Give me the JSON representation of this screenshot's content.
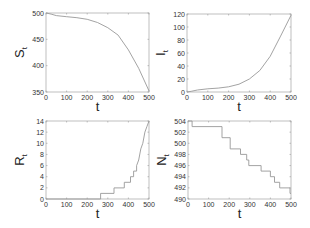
{
  "chart_data": [
    {
      "type": "line",
      "id": "S",
      "title": "",
      "xlabel": "t",
      "ylabel": "S",
      "ylabel_sub": "t",
      "xlim": [
        0,
        500
      ],
      "ylim": [
        350,
        500
      ],
      "xticks": [
        0,
        100,
        200,
        300,
        400,
        500
      ],
      "yticks": [
        350,
        400,
        450,
        500
      ],
      "grid": false,
      "color": "#999999",
      "x": [
        0,
        25,
        50,
        100,
        150,
        200,
        250,
        300,
        350,
        400,
        450,
        500
      ],
      "y": [
        500,
        498,
        495,
        493,
        491,
        488,
        482,
        472,
        458,
        430,
        395,
        352
      ]
    },
    {
      "type": "line",
      "id": "I",
      "title": "",
      "xlabel": "t",
      "ylabel": "I",
      "ylabel_sub": "t",
      "xlim": [
        0,
        500
      ],
      "ylim": [
        0,
        120
      ],
      "xticks": [
        0,
        100,
        200,
        300,
        400,
        500
      ],
      "yticks": [
        0,
        20,
        40,
        60,
        80,
        100,
        120
      ],
      "grid": false,
      "color": "#999999",
      "x": [
        0,
        20,
        50,
        100,
        150,
        200,
        250,
        300,
        350,
        400,
        450,
        500
      ],
      "y": [
        0,
        1,
        3,
        5,
        6,
        8,
        12,
        20,
        33,
        55,
        86,
        118
      ]
    },
    {
      "type": "line",
      "id": "R",
      "title": "",
      "xlabel": "t",
      "ylabel": "R",
      "ylabel_sub": "t",
      "xlim": [
        0,
        500
      ],
      "ylim": [
        0,
        14
      ],
      "xticks": [
        0,
        100,
        200,
        300,
        400,
        500
      ],
      "yticks": [
        0,
        2,
        4,
        6,
        8,
        10,
        12,
        14
      ],
      "grid": false,
      "color": "#999999",
      "step": true,
      "x": [
        0,
        265,
        265,
        330,
        330,
        380,
        380,
        410,
        410,
        425,
        425,
        440,
        440,
        450,
        460,
        470,
        480,
        490,
        500
      ],
      "y": [
        0,
        0,
        1,
        1,
        2,
        2,
        3,
        3,
        4,
        4,
        5,
        5,
        6,
        7,
        9,
        10,
        12,
        13,
        14
      ]
    },
    {
      "type": "line",
      "id": "N",
      "title": "",
      "xlabel": "t",
      "ylabel": "N",
      "ylabel_sub": "t",
      "xlim": [
        0,
        500
      ],
      "ylim": [
        490,
        504
      ],
      "xticks": [
        0,
        100,
        200,
        300,
        400,
        500
      ],
      "yticks": [
        490,
        492,
        494,
        496,
        498,
        500,
        502,
        504
      ],
      "grid": false,
      "color": "#999999",
      "step": true,
      "x": [
        0,
        20,
        20,
        165,
        165,
        205,
        205,
        255,
        255,
        285,
        285,
        295,
        295,
        355,
        355,
        400,
        400,
        420,
        420,
        445,
        445,
        495,
        495,
        500
      ],
      "y": [
        504,
        504,
        503,
        503,
        501,
        501,
        499,
        499,
        498,
        498,
        497,
        497,
        496,
        496,
        495,
        495,
        494,
        494,
        493,
        493,
        492,
        492,
        491,
        491
      ]
    }
  ],
  "panels": [
    {
      "id": "S",
      "ylabel": "S",
      "ylabel_sub": "t",
      "xlabel": "t"
    },
    {
      "id": "I",
      "ylabel": "I",
      "ylabel_sub": "t",
      "xlabel": "t"
    },
    {
      "id": "R",
      "ylabel": "R",
      "ylabel_sub": "t",
      "xlabel": "t"
    },
    {
      "id": "N",
      "ylabel": "N",
      "ylabel_sub": "t",
      "xlabel": "t"
    }
  ]
}
